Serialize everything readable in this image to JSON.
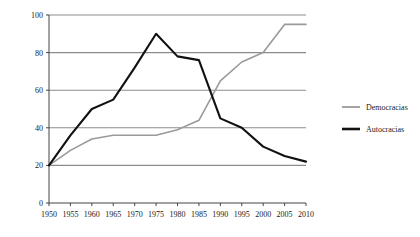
{
  "chart_data": {
    "type": "line",
    "title": "",
    "xlabel": "",
    "ylabel": "",
    "x": [
      1950,
      1955,
      1960,
      1965,
      1970,
      1975,
      1980,
      1985,
      1990,
      1995,
      2000,
      2005,
      2010
    ],
    "xlim": [
      1950,
      2010
    ],
    "ylim": [
      0,
      100
    ],
    "xticks": [
      "1950",
      "1955",
      "1960",
      "1965",
      "1970",
      "1975",
      "1980",
      "1985",
      "1990",
      "1995",
      "2000",
      "2005",
      "2010"
    ],
    "yticks": [
      "0",
      "20",
      "40",
      "60",
      "80",
      "100"
    ],
    "ytick_values": [
      0,
      20,
      40,
      60,
      80,
      100
    ],
    "grid": "horizontal",
    "legend_position": "right",
    "series": [
      {
        "name": "Democracias",
        "color": "#9a9a9a",
        "values": [
          20,
          28,
          34,
          36,
          36,
          36,
          39,
          44,
          65,
          75,
          80,
          95,
          95
        ]
      },
      {
        "name": "Autocracias",
        "color": "#111111",
        "values": [
          20,
          36,
          50,
          55,
          72,
          90,
          78,
          76,
          45,
          40,
          30,
          25,
          22
        ]
      }
    ]
  },
  "legend": {
    "items": [
      {
        "label": "Democracias",
        "color": "#9a9a9a",
        "width": 1.8
      },
      {
        "label": "Autocracias",
        "color": "#111111",
        "width": 2.6
      }
    ]
  },
  "axis": {
    "line_color": "#444444",
    "grid_color": "#8c8c8c"
  }
}
